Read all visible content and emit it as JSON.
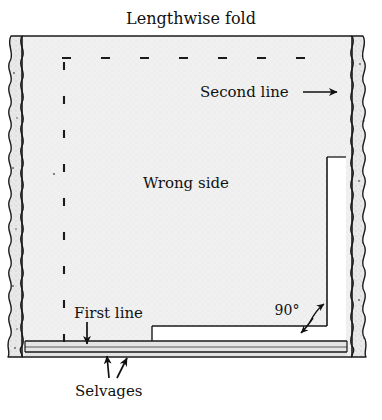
{
  "figure": {
    "type": "sewing-fabric-layout-diagram",
    "title_label": "Lengthwise fold",
    "fabric_face_label": "Wrong side",
    "first_line_label": "First line",
    "second_line_label": "Second line",
    "selvages_label": "Selvages",
    "angle_label": "90°",
    "arrow_glyph_right": "→",
    "arrow_glyph_down": "↓",
    "arrow_glyph_up": "↑"
  },
  "colors": {
    "fabric_fill": "#f0f0f0",
    "fabric_fill_alt": "#eaeaea",
    "selvage_fill": "#e6e6e6",
    "hem_fill": "#e2e2e2",
    "notch_fill": "#ffffff",
    "ink": "#111111",
    "line": "#1a1a1a",
    "page_background": "#ffffff"
  },
  "geometry": {
    "fabric_left": 22,
    "fabric_top": 36,
    "fabric_right": 352,
    "fabric_bottom": 357,
    "top_dashed_y": 58,
    "top_dashed_x1": 62,
    "top_dashed_x2": 334,
    "left_dashed_x": 64,
    "left_dashed_y1": 58,
    "left_dashed_y2": 344,
    "second_line_x": 327,
    "notch_top_y": 157,
    "notch_bottom_y": 341,
    "first_strip_y": 326,
    "first_strip_x": 152,
    "hem_top_y": 341,
    "hem_bottom_y": 356
  }
}
